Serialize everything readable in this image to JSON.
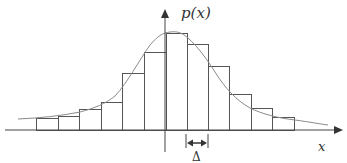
{
  "diagram": {
    "y_axis_label": "p(x)",
    "x_axis_label": "x",
    "bin_width_label": "Δ",
    "colors": {
      "bars": "#555555",
      "curve": "#888888",
      "axes": "#444444"
    }
  },
  "chart_data": {
    "type": "bar",
    "title": "",
    "xlabel": "x",
    "ylabel": "p(x)",
    "bin_edges_px": [
      36,
      58,
      79,
      101,
      122,
      144,
      166,
      187,
      208,
      229,
      251,
      272,
      294
    ],
    "bar_tops_px": [
      118,
      116,
      109,
      102,
      73,
      52,
      33,
      44,
      66,
      94,
      108,
      117
    ],
    "baseline_px": 130,
    "grid": false,
    "legend": false
  }
}
